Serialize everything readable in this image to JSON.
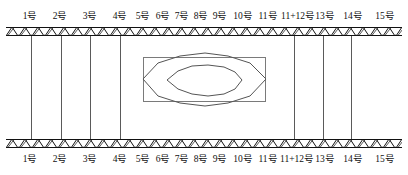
{
  "figure": {
    "width": 408,
    "height": 175,
    "background_color": "#ffffff",
    "line_color": "#111111",
    "contour_color": "#555555",
    "box_color": "#7a7a7a"
  },
  "bands": {
    "hatch_style": "diagonal-zigzag",
    "top": {
      "name": "top-ground-band",
      "y": 27,
      "height": 9
    },
    "bottom": {
      "name": "bottom-ground-band",
      "y": 139,
      "height": 9
    }
  },
  "labels_top": [
    {
      "text": "1号",
      "x": 30
    },
    {
      "text": "2号",
      "x": 60
    },
    {
      "text": "3号",
      "x": 90
    },
    {
      "text": "4号",
      "x": 120
    },
    {
      "text": "5号",
      "x": 143
    },
    {
      "text": "6号",
      "x": 163
    },
    {
      "text": "7号",
      "x": 182
    },
    {
      "text": "8号",
      "x": 201
    },
    {
      "text": "9号",
      "x": 220
    },
    {
      "text": "10号",
      "x": 243
    },
    {
      "text": "11号",
      "x": 268
    },
    {
      "text": "11+12号",
      "x": 298
    },
    {
      "text": "13号",
      "x": 325
    },
    {
      "text": "14号",
      "x": 353
    },
    {
      "text": "15号",
      "x": 385
    }
  ],
  "labels_bottom": [
    {
      "text": "1号",
      "x": 30
    },
    {
      "text": "2号",
      "x": 60
    },
    {
      "text": "3号",
      "x": 90
    },
    {
      "text": "4号",
      "x": 120
    },
    {
      "text": "5号",
      "x": 143
    },
    {
      "text": "6号",
      "x": 163
    },
    {
      "text": "7号",
      "x": 182
    },
    {
      "text": "8号",
      "x": 201
    },
    {
      "text": "9号",
      "x": 220
    },
    {
      "text": "10号",
      "x": 243
    },
    {
      "text": "11号",
      "x": 268
    },
    {
      "text": "11+12号",
      "x": 297
    },
    {
      "text": "13号",
      "x": 325
    },
    {
      "text": "14号",
      "x": 353
    },
    {
      "text": "15号",
      "x": 385
    }
  ],
  "vertical_lines": [
    {
      "name": "member-line-1",
      "x": 31
    },
    {
      "name": "member-line-2",
      "x": 61
    },
    {
      "name": "member-line-3",
      "x": 90
    },
    {
      "name": "member-line-4",
      "x": 120
    },
    {
      "name": "member-line-13",
      "x": 294
    },
    {
      "name": "member-line-14",
      "x": 323
    },
    {
      "name": "member-line-15",
      "x": 351
    }
  ],
  "center_box": {
    "name": "central-zone-box",
    "x": 143,
    "y": 57,
    "width": 123,
    "height": 45
  },
  "contours": [
    {
      "name": "outer-contour",
      "points": "143,79 158,63 180,56 205,53 228,56 250,63 266,79 250,96 228,103 205,106 180,103 158,96"
    },
    {
      "name": "inner-contour",
      "points": "167,80 178,71 192,66 208,65 224,67 235,72 242,80 235,89 224,94 208,96 192,94 178,89"
    }
  ]
}
